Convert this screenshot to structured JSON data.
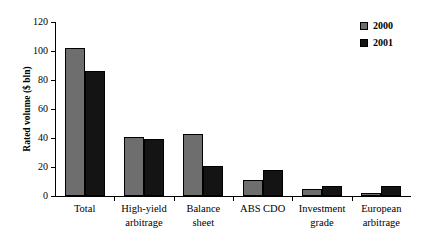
{
  "chart_data": {
    "type": "bar",
    "title": "",
    "subtitle": "",
    "xlabel": "",
    "ylabel": "Rated volume ($ bln)",
    "ylim": [
      0,
      120
    ],
    "ytick_labels": [
      "0",
      "20",
      "40",
      "60",
      "80",
      "100",
      "120"
    ],
    "ytick_values": [
      0,
      20,
      40,
      60,
      80,
      100,
      120
    ],
    "grid": false,
    "legend_position": "top-right",
    "categories": [
      "Total",
      "High-yield\narbitrage",
      "Balance\nsheet",
      "ABS CDO",
      "Investment\ngrade",
      "European\narbitrage"
    ],
    "series": [
      {
        "name": "2000",
        "color": "#6e6e6e",
        "values": [
          102,
          41,
          43,
          11,
          5,
          2
        ]
      },
      {
        "name": "2001",
        "color": "#141414",
        "values": [
          86,
          39,
          21,
          18,
          7,
          7
        ]
      }
    ]
  },
  "legend": {
    "items": [
      {
        "label": "2000",
        "color": "#6e6e6e"
      },
      {
        "label": "2001",
        "color": "#141414"
      }
    ]
  }
}
